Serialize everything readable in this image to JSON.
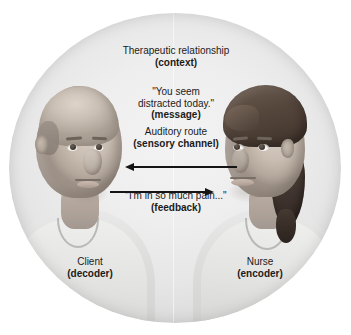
{
  "diagram": {
    "title_absent": true,
    "shape": "circle",
    "background_color": "#ffffff",
    "circle_fill": "#ececec",
    "arrow_color": "#141414",
    "text_color": "#1b1b1b"
  },
  "labels": {
    "context": {
      "line1": "Therapeutic relationship",
      "line2": "(context)"
    },
    "message": {
      "line1": "\"You seem",
      "line2": "distracted today.\"",
      "line3": "(message)"
    },
    "channel": {
      "line1": "Auditory route",
      "line2": "(sensory channel)"
    },
    "feedback": {
      "line1": "\"I'm in so much pain...\"",
      "line2": "(feedback)"
    },
    "client": {
      "line1": "Client",
      "line2": "(decoder)"
    },
    "nurse": {
      "line1": "Nurse",
      "line2": "(encoder)"
    }
  },
  "figures": {
    "left": {
      "role": "Client",
      "function": "decoder",
      "facing": "right",
      "description": "bald man"
    },
    "right": {
      "role": "Nurse",
      "function": "encoder",
      "facing": "left",
      "description": "woman with ponytail"
    }
  },
  "arrows": [
    {
      "name": "message-arrow",
      "direction": "left",
      "from": "Nurse",
      "to": "Client"
    },
    {
      "name": "feedback-arrow",
      "direction": "right",
      "from": "Client",
      "to": "Nurse"
    }
  ]
}
